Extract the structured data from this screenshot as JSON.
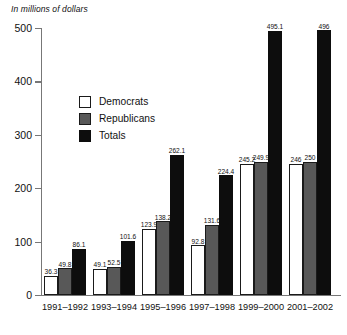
{
  "chart_data": {
    "type": "bar",
    "title": "",
    "subtitle": "In millions of dollars",
    "xlabel": "",
    "ylabel": "",
    "ylim": [
      0,
      500
    ],
    "yticks": [
      0,
      100,
      200,
      300,
      400,
      500
    ],
    "ytick_labels": [
      "0",
      "100",
      "200",
      "300",
      "400",
      "500"
    ],
    "grid": false,
    "legend_position": "upper-left-inside",
    "categories": [
      "1991–1992",
      "1993–1994",
      "1995–1996",
      "1997–1998",
      "1999–2000",
      "2001–2002"
    ],
    "series": [
      {
        "name": "Democrats",
        "color": "#ffffff",
        "values": [
          36.3,
          49.1,
          123.9,
          92.8,
          245.2,
          246
        ],
        "labels": [
          "36.3",
          "49.1",
          "123.9",
          "92.8",
          "245.2",
          "246"
        ]
      },
      {
        "name": "Republicans",
        "color": "#585858",
        "values": [
          49.8,
          52.5,
          138.2,
          131.6,
          249.9,
          250
        ],
        "labels": [
          "49.8",
          "52.5",
          "138.2",
          "131.6",
          "249.9",
          "250"
        ]
      },
      {
        "name": "Totals",
        "color": "#0d0d0d",
        "values": [
          86.1,
          101.6,
          262.1,
          224.4,
          495.1,
          496
        ],
        "labels": [
          "86.1",
          "101.6",
          "262.1",
          "224.4",
          "495.1",
          "496"
        ]
      }
    ]
  },
  "legend": {
    "items": [
      {
        "label": "Democrats",
        "swatch": "dem"
      },
      {
        "label": "Republicans",
        "swatch": "rep"
      },
      {
        "label": "Totals",
        "swatch": "tot"
      }
    ]
  }
}
